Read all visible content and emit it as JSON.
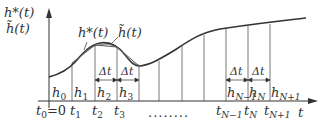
{
  "axes": {
    "y_label_top": "h*(t)",
    "y_label_bottom": "h̃(t)",
    "x_label": "t"
  },
  "curve_labels": {
    "true": "h*(t)",
    "approx": "h̃(t)"
  },
  "delta": "Δt",
  "ellipsis": "........",
  "h_labels": [
    "h",
    "h",
    "h",
    "h",
    "h",
    "h",
    "h"
  ],
  "h_subs": [
    "0",
    "1",
    "2",
    "3",
    "N−1",
    "N",
    "N+1"
  ],
  "t_labels": [
    "t",
    "t",
    "t",
    "t",
    "t",
    "t",
    "t"
  ],
  "t_subs": [
    "0",
    "1",
    "2",
    "3",
    "N−1",
    "N",
    "N+1"
  ],
  "t0_suffix": "=0",
  "colors": {
    "line": "#333333",
    "background": "#ffffff"
  }
}
